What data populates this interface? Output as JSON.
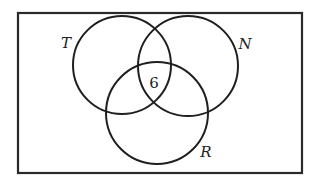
{
  "diagram": {
    "type": "venn",
    "universe": {
      "x": 18,
      "y": 13,
      "width": 284,
      "height": 160
    },
    "sets": [
      {
        "id": "T",
        "label": "T",
        "cx": 122,
        "cy": 65,
        "r": 49,
        "label_x": 66,
        "label_y": 48
      },
      {
        "id": "N",
        "label": "N",
        "cx": 188,
        "cy": 66,
        "r": 50,
        "label_x": 245,
        "label_y": 49
      },
      {
        "id": "R",
        "label": "R",
        "cx": 157,
        "cy": 113,
        "r": 51,
        "label_x": 206,
        "label_y": 157
      }
    ],
    "regions": [
      {
        "name": "T∩N∩R",
        "value": "6",
        "x": 154,
        "y": 88
      }
    ]
  }
}
